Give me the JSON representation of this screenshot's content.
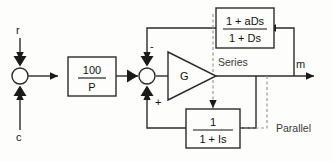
{
  "diagram": {
    "signals": {
      "reference_input": "r",
      "secondary_input": "c",
      "output": "m"
    },
    "annotations": {
      "series": "Series",
      "parallel": "Parallel"
    },
    "blocks": [
      {
        "id": "gain-block",
        "name": "proportional-gain-block",
        "numerator": "100",
        "denominator": "P"
      },
      {
        "id": "amplifier",
        "name": "amplifier-triangle",
        "label": "G"
      },
      {
        "id": "series-compensator",
        "name": "series-compensator-block",
        "numerator": "1 + aDs",
        "denominator": "1 + Ds"
      },
      {
        "id": "parallel-feedback",
        "name": "parallel-feedback-block",
        "numerator": "1",
        "denominator": "1 + Is"
      }
    ],
    "summing_junctions": [
      {
        "id": "sum-left",
        "name": "summing-junction-left",
        "top_sign": "",
        "bottom_sign": ""
      },
      {
        "id": "sum-right",
        "name": "summing-junction-right",
        "top_sign": "-",
        "bottom_sign": "+"
      }
    ],
    "colors": {
      "line": "#2b2b2b",
      "dashed": "#9a9a9a",
      "text": "#111111",
      "background": "#fdfdfb"
    }
  }
}
